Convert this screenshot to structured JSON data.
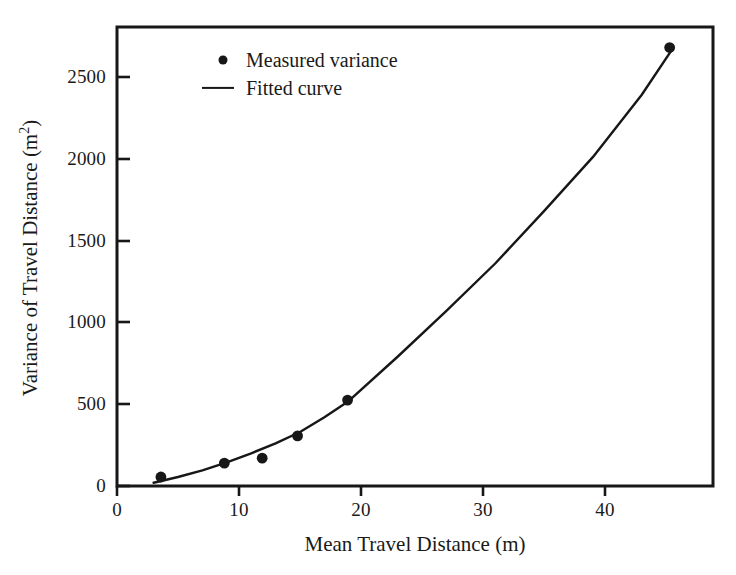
{
  "chart_data": {
    "type": "scatter",
    "title": "",
    "xlabel": "Mean Travel Distance (m)",
    "ylabel_text": "Variance of Travel Distance (m",
    "ylabel_sup": "2",
    "ylabel_tail": ")",
    "ylabel_full": "Variance of Travel Distance (m2)",
    "xlim": [
      0,
      49
    ],
    "ylim": [
      0,
      2800
    ],
    "xticks": [
      0,
      10,
      20,
      30,
      40
    ],
    "xtick_labels": [
      "0",
      "10",
      "20",
      "30",
      "40"
    ],
    "yticks": [
      0,
      500,
      1000,
      1500,
      2000,
      2500
    ],
    "ytick_labels": [
      "0",
      "500",
      "1000",
      "1500",
      "2000",
      "2500"
    ],
    "grid": false,
    "legend_position": "top-left-inside",
    "series": [
      {
        "name": "Measured variance",
        "marker": "filled-circle",
        "color": "#171717",
        "x": [
          3.6,
          8.8,
          11.9,
          14.8,
          18.9,
          45.3
        ],
        "y": [
          55,
          140,
          170,
          306,
          525,
          2680
        ]
      },
      {
        "name": "Fitted curve",
        "marker": "line",
        "color": "#171717",
        "x": [
          3.0,
          5.0,
          7.0,
          9.0,
          11.0,
          13.0,
          15.0,
          17.0,
          19.0,
          23.0,
          27.0,
          31.0,
          35.0,
          39.0,
          43.0,
          45.6
        ],
        "y": [
          20,
          55,
          95,
          145,
          200,
          260,
          330,
          420,
          520,
          790,
          1070,
          1360,
          1680,
          2010,
          2390,
          2680
        ]
      }
    ],
    "legend": [
      {
        "label": "Measured variance",
        "key": "dot"
      },
      {
        "label": "Fitted curve",
        "key": "line"
      }
    ],
    "axis_color": "#171717",
    "background": "#ffffff"
  }
}
